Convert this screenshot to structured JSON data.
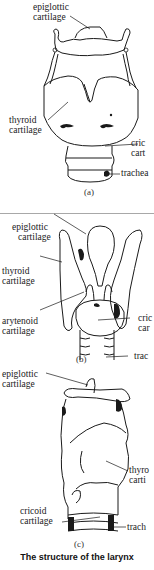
{
  "caption": "The structure of the larynx",
  "figures": [
    {
      "id": "a",
      "label": "(a)",
      "callouts": {
        "epiglottic": [
          "epiglottic",
          "cartilage"
        ],
        "thyroid": [
          "thyroid",
          "cartilage"
        ],
        "cricoid": [
          "cric",
          "cart"
        ],
        "trachea": [
          "trachea"
        ]
      }
    },
    {
      "id": "b",
      "label": "(b)",
      "callouts": {
        "epiglottic": [
          "epiglottic",
          "cartilage"
        ],
        "thyroid": [
          "thyroid",
          "cartilage"
        ],
        "arytenoid": [
          "arytenoid",
          "cartilage"
        ],
        "cricoid": [
          "cric",
          "car"
        ],
        "trachea": [
          "trac"
        ]
      }
    },
    {
      "id": "c",
      "label": "(c)",
      "callouts": {
        "epiglottic": [
          "epiglottic",
          "cartilage"
        ],
        "thyroid": [
          "thyro",
          "carti"
        ],
        "cricoid": [
          "cricoid",
          "cartilage"
        ],
        "trachea": [
          "trach"
        ]
      }
    }
  ],
  "colors": {
    "line": "#1a1a1a",
    "rule": "#a8a8a8",
    "background": "#ffffff"
  }
}
